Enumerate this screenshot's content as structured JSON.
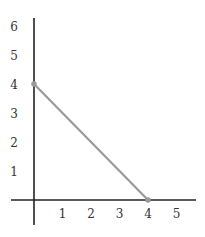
{
  "chart_data": {
    "type": "line",
    "title": "",
    "xlabel": "",
    "ylabel": "",
    "xlim": [
      -1,
      5.6
    ],
    "ylim": [
      -1,
      6.3
    ],
    "grid": false,
    "legend": null,
    "x_ticks": [
      "1",
      "2",
      "3",
      "4",
      "5"
    ],
    "y_ticks": [
      "1",
      "2",
      "3",
      "4",
      "5",
      "6"
    ],
    "series": [
      {
        "name": "segment",
        "x": [
          0,
          4
        ],
        "y": [
          4,
          0
        ],
        "color": "#9a9a9a",
        "markers": true
      }
    ]
  },
  "colors": {
    "axis": "#222222",
    "line": "#9a9a9a",
    "marker": "#9a9a9a",
    "text": "#333333"
  }
}
